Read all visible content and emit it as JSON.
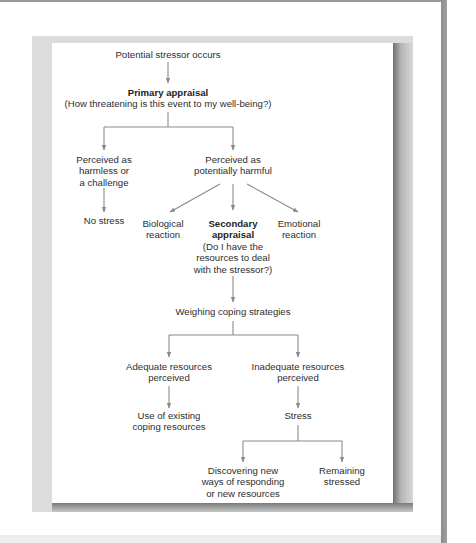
{
  "diagram": {
    "type": "flowchart",
    "line_color": "#8a8a8a",
    "nodes": {
      "stressor": {
        "lines": [
          "Potential stressor occurs"
        ]
      },
      "primary": {
        "title": "Primary appraisal",
        "lines": [
          "(How threatening is this event to my well-being?)"
        ]
      },
      "harmless": {
        "lines": [
          "Perceived as",
          "harmless or",
          "a challenge"
        ]
      },
      "harmful": {
        "lines": [
          "Perceived as",
          "potentially harmful"
        ]
      },
      "no_stress": {
        "lines": [
          "No stress"
        ]
      },
      "biological": {
        "lines": [
          "Biological",
          "reaction"
        ]
      },
      "secondary": {
        "title_lines": [
          "Secondary",
          "appraisal"
        ],
        "lines": [
          "(Do I have the",
          "resources to deal",
          "with the stressor?)"
        ]
      },
      "emotional": {
        "lines": [
          "Emotional",
          "reaction"
        ]
      },
      "weighing": {
        "lines": [
          "Weighing coping strategies"
        ]
      },
      "adequate": {
        "lines": [
          "Adequate resources",
          "perceived"
        ]
      },
      "inadequate": {
        "lines": [
          "Inadequate resources",
          "perceived"
        ]
      },
      "existing": {
        "lines": [
          "Use of existing",
          "coping resources"
        ]
      },
      "stress": {
        "lines": [
          "Stress"
        ]
      },
      "discovering": {
        "lines": [
          "Discovering new",
          "ways of responding",
          "or new resources"
        ]
      },
      "remaining": {
        "lines": [
          "Remaining",
          "stressed"
        ]
      }
    },
    "edges": [
      [
        "stressor",
        "primary"
      ],
      [
        "primary",
        "harmless"
      ],
      [
        "primary",
        "harmful"
      ],
      [
        "harmless",
        "no_stress"
      ],
      [
        "harmful",
        "biological"
      ],
      [
        "harmful",
        "secondary"
      ],
      [
        "harmful",
        "emotional"
      ],
      [
        "secondary",
        "weighing"
      ],
      [
        "weighing",
        "adequate"
      ],
      [
        "weighing",
        "inadequate"
      ],
      [
        "adequate",
        "existing"
      ],
      [
        "inadequate",
        "stress"
      ],
      [
        "stress",
        "discovering"
      ],
      [
        "stress",
        "remaining"
      ]
    ]
  }
}
